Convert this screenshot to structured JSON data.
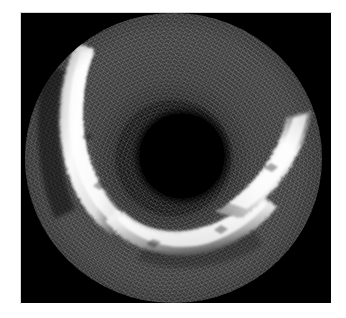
{
  "page": {
    "background_color": "#ffffff",
    "width": 346,
    "height": 318,
    "caption": ""
  },
  "image": {
    "modality_name": "intravascular-ultrasound-cross-section",
    "frame": {
      "left": 21,
      "top": 13,
      "width": 310,
      "height": 290,
      "background_color": "#000000"
    },
    "colors": {
      "background": "#000000",
      "tissue_speckle_mid": "#2a2a2a",
      "tissue_speckle_dark": "#141414",
      "plaque_bright": "#f2f2f2",
      "plaque_highlight": "#ffffff",
      "lumen": "#000000",
      "page_white": "#ffffff"
    },
    "field_of_view": {
      "label": "scan-disc",
      "center_x": 153,
      "center_y": 145,
      "radius": 148
    },
    "lumen": {
      "label": "central-lumen",
      "center_x": 157,
      "center_y": 143,
      "radius": 43
    },
    "structures": [
      {
        "name": "plaque-crescent-left",
        "description": "bright arc upper-left"
      },
      {
        "name": "plaque-crescent-bottom",
        "description": "bright arc lower-center"
      },
      {
        "name": "plaque-crescent-right",
        "description": "bright band lower-right rising to mid-right"
      }
    ]
  }
}
